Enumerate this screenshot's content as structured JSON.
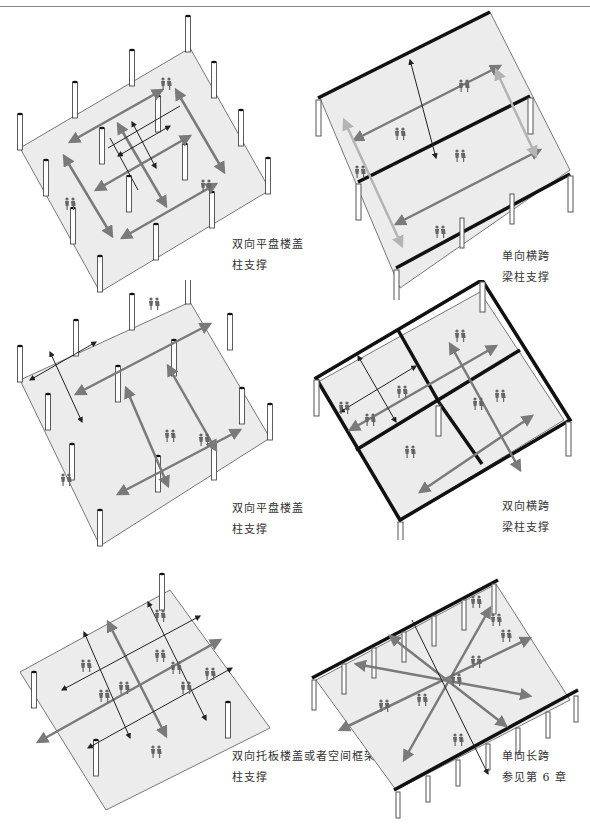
{
  "header": {
    "running_text": "",
    "rule": true
  },
  "colors": {
    "floor": "#ececec",
    "floor_edge": "#777777",
    "arrow_primary": "#7a7a7a",
    "arrow_secondary": "#222222",
    "arrow_light": "#b4b4b4",
    "beam": "#111111",
    "people": "#666666"
  },
  "panels": [
    {
      "id": "two-way-flat-slab-a",
      "label_line1": "双向平盘楼盖",
      "label_line2": "柱支撑"
    },
    {
      "id": "one-way-span-beams",
      "label_line1": "单向横跨",
      "label_line2": "梁柱支撑"
    },
    {
      "id": "two-way-flat-slab-b",
      "label_line1": "双向平盘楼盖",
      "label_line2": "柱支撑"
    },
    {
      "id": "two-way-span-beams",
      "label_line1": "双向横跨",
      "label_line2": "梁柱支撑"
    },
    {
      "id": "two-way-waffle-space-frame",
      "label_line1": "双向托板楼盖或者空间框架",
      "label_line2": "柱支撑"
    },
    {
      "id": "one-way-long-span",
      "label_line1": "单向长跨",
      "label_line2": "参见第 6 章"
    }
  ]
}
